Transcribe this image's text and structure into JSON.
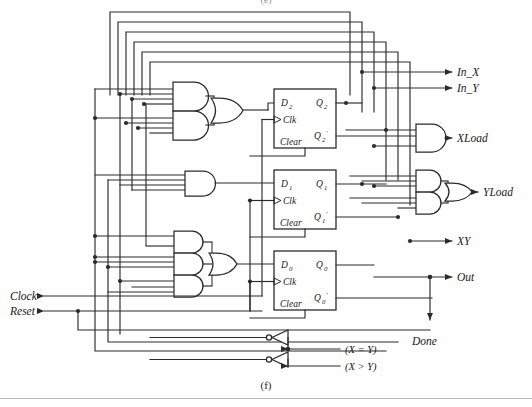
{
  "figure": {
    "caption_bottom": "(f)",
    "caption_top": "(e)",
    "type": "digital-logic-schematic"
  },
  "inputs": [
    {
      "id": "clock",
      "label": "Clock",
      "side": "left"
    },
    {
      "id": "reset",
      "label": "Reset",
      "side": "left"
    },
    {
      "id": "x_eq_y",
      "label": "(X = Y)",
      "side": "bottom-right"
    },
    {
      "id": "x_gt_y",
      "label": "(X > Y)",
      "side": "bottom-right"
    }
  ],
  "outputs": [
    {
      "id": "in_x",
      "label": "In_X"
    },
    {
      "id": "in_y",
      "label": "In_Y"
    },
    {
      "id": "xload",
      "label": "XLoad"
    },
    {
      "id": "yload",
      "label": "YLoad"
    },
    {
      "id": "xy",
      "label": "XY"
    },
    {
      "id": "out",
      "label": "Out"
    },
    {
      "id": "done",
      "label": "Done"
    }
  ],
  "flipflops": [
    {
      "id": "ff2",
      "d": "D",
      "d_sub": "2",
      "q": "Q",
      "q_sub": "2",
      "clk": "Clk",
      "clear": "Clear",
      "qbar": "Q",
      "qbar_sub": "2",
      "qbar_prime": "'"
    },
    {
      "id": "ff1",
      "d": "D",
      "d_sub": "1",
      "q": "Q",
      "q_sub": "1",
      "clk": "Clk",
      "clear": "Clear",
      "qbar": "Q",
      "qbar_sub": "1",
      "qbar_prime": "'"
    },
    {
      "id": "ff0",
      "d": "D",
      "d_sub": "0",
      "q": "Q",
      "q_sub": "0",
      "clk": "Clk",
      "clear": "Clear",
      "qbar": "Q",
      "qbar_sub": "0",
      "qbar_prime": "'"
    }
  ],
  "gates": {
    "d2_and_count": 2,
    "d2_or_count": 1,
    "d1_and_count": 1,
    "d0_and_count": 3,
    "d0_or_count": 1,
    "xload_and_count": 1,
    "yload_and_count": 2,
    "yload_or_count": 1,
    "inverter_count": 2
  },
  "colors": {
    "wire": "#2b2b2b",
    "gate_fill": "#ffffff",
    "background": "#fefefe",
    "text": "#1a1a1a"
  }
}
